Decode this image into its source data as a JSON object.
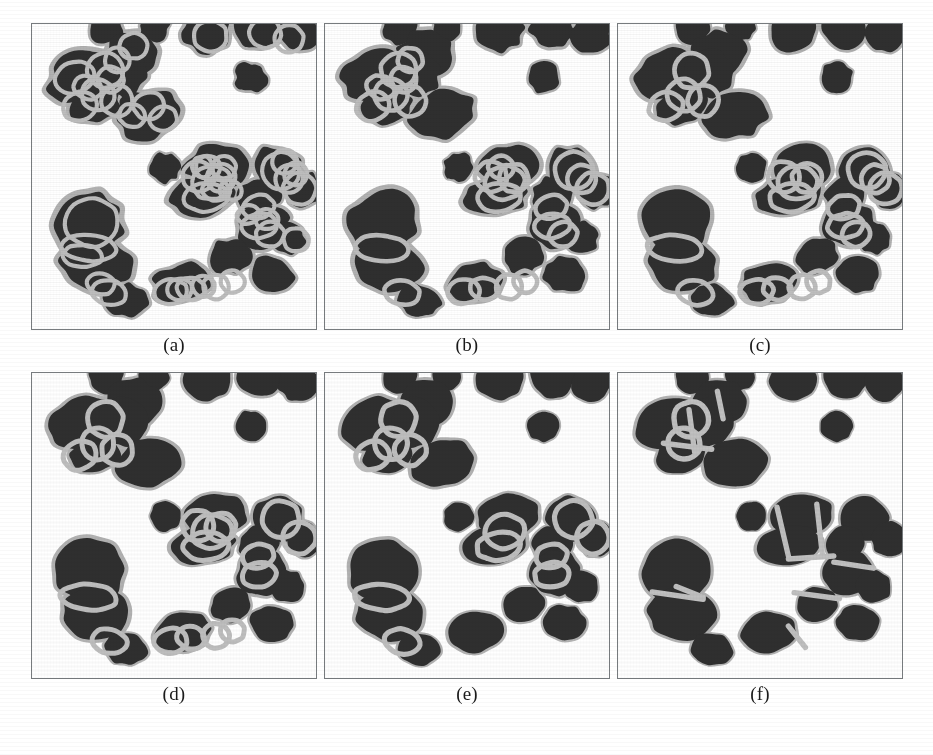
{
  "figure": {
    "background_color": "#ffffff",
    "panel_border_color": "#777b7e",
    "cell_fill_color": "#2f2f2f",
    "cell_halo_color": "#b2b2b2",
    "contour_color": "#b8b8b8",
    "caption_color": "#1a1a1a",
    "rows": 2,
    "columns": 3
  },
  "panels": [
    {
      "id": "a",
      "caption": "(a)",
      "x": 31,
      "y": 23,
      "width": 286,
      "height": 307,
      "caption_x": 31,
      "caption_y": 334,
      "caption_width": 286,
      "stage": "initial contour seeding",
      "contour_count": 46,
      "contour_style": "dense-overlapping",
      "contour_stroke": 4.2,
      "contour_color": "#bdbdbd",
      "blob_roughness": 0.16
    },
    {
      "id": "b",
      "caption": "(b)",
      "x": 324,
      "y": 23,
      "width": 286,
      "height": 307,
      "caption_x": 324,
      "caption_y": 334,
      "caption_width": 286,
      "stage": "iteration 1",
      "contour_count": 24,
      "contour_style": "overlapping",
      "contour_stroke": 4.6,
      "contour_color": "#bcbcbc",
      "blob_roughness": 0.12
    },
    {
      "id": "c",
      "caption": "(c)",
      "x": 617,
      "y": 23,
      "width": 286,
      "height": 307,
      "caption_x": 617,
      "caption_y": 334,
      "caption_width": 286,
      "stage": "iteration 2",
      "contour_count": 20,
      "contour_style": "overlapping",
      "contour_stroke": 4.8,
      "contour_color": "#bdbdbd",
      "blob_roughness": 0.1
    },
    {
      "id": "d",
      "caption": "(d)",
      "x": 31,
      "y": 372,
      "width": 286,
      "height": 307,
      "caption_x": 31,
      "caption_y": 683,
      "caption_width": 286,
      "stage": "iteration 3",
      "contour_count": 18,
      "contour_style": "overlapping",
      "contour_stroke": 5.0,
      "contour_color": "#bebebe",
      "blob_roughness": 0.09
    },
    {
      "id": "e",
      "caption": "(e)",
      "x": 324,
      "y": 372,
      "width": 286,
      "height": 307,
      "caption_x": 324,
      "caption_y": 683,
      "caption_width": 286,
      "stage": "iteration 4",
      "contour_count": 12,
      "contour_style": "sparse",
      "contour_stroke": 5.2,
      "contour_color": "#bebebe",
      "blob_roughness": 0.07
    },
    {
      "id": "f",
      "caption": "(f)",
      "x": 617,
      "y": 372,
      "width": 286,
      "height": 307,
      "caption_x": 617,
      "caption_y": 683,
      "caption_width": 286,
      "stage": "final segmentation",
      "contour_count": 2,
      "contour_style": "boundaries-only",
      "contour_stroke": 5.4,
      "contour_color": "#c0c0c0",
      "blob_roughness": 0.06
    }
  ],
  "cells": [
    {
      "cx": 0.262,
      "cy": 0.012,
      "rx": 0.06,
      "ry": 0.055,
      "rot": -12
    },
    {
      "cx": 0.43,
      "cy": 0.01,
      "rx": 0.052,
      "ry": 0.046,
      "rot": 8
    },
    {
      "cx": 0.615,
      "cy": 0.02,
      "rx": 0.082,
      "ry": 0.07,
      "rot": -6
    },
    {
      "cx": 0.8,
      "cy": 0.012,
      "rx": 0.078,
      "ry": 0.068,
      "rot": 14
    },
    {
      "cx": 0.938,
      "cy": 0.03,
      "rx": 0.07,
      "ry": 0.062,
      "rot": -18
    },
    {
      "cx": 0.355,
      "cy": 0.098,
      "rx": 0.098,
      "ry": 0.078,
      "rot": -8
    },
    {
      "cx": 0.175,
      "cy": 0.165,
      "rx": 0.118,
      "ry": 0.082,
      "rot": -22
    },
    {
      "cx": 0.318,
      "cy": 0.16,
      "rx": 0.085,
      "ry": 0.082,
      "rot": 10
    },
    {
      "cx": 0.222,
      "cy": 0.268,
      "rx": 0.09,
      "ry": 0.058,
      "rot": -14
    },
    {
      "cx": 0.412,
      "cy": 0.295,
      "rx": 0.113,
      "ry": 0.078,
      "rot": -10
    },
    {
      "cx": 0.77,
      "cy": 0.175,
      "rx": 0.056,
      "ry": 0.05,
      "rot": 0
    },
    {
      "cx": 0.47,
      "cy": 0.47,
      "rx": 0.052,
      "ry": 0.048,
      "rot": 0
    },
    {
      "cx": 0.648,
      "cy": 0.468,
      "rx": 0.108,
      "ry": 0.072,
      "rot": -6
    },
    {
      "cx": 0.868,
      "cy": 0.478,
      "rx": 0.088,
      "ry": 0.072,
      "rot": 16
    },
    {
      "cx": 0.6,
      "cy": 0.565,
      "rx": 0.115,
      "ry": 0.062,
      "rot": -9
    },
    {
      "cx": 0.8,
      "cy": 0.56,
      "rx": 0.072,
      "ry": 0.058,
      "rot": -20
    },
    {
      "cx": 0.955,
      "cy": 0.545,
      "rx": 0.062,
      "ry": 0.058,
      "rot": 6
    },
    {
      "cx": 0.205,
      "cy": 0.65,
      "rx": 0.118,
      "ry": 0.105,
      "rot": -5
    },
    {
      "cx": 0.225,
      "cy": 0.79,
      "rx": 0.118,
      "ry": 0.085,
      "rot": 6
    },
    {
      "cx": 0.81,
      "cy": 0.655,
      "rx": 0.088,
      "ry": 0.075,
      "rot": -12
    },
    {
      "cx": 0.9,
      "cy": 0.7,
      "rx": 0.062,
      "ry": 0.052,
      "rot": 12
    },
    {
      "cx": 0.7,
      "cy": 0.76,
      "rx": 0.072,
      "ry": 0.058,
      "rot": -16
    },
    {
      "cx": 0.53,
      "cy": 0.85,
      "rx": 0.098,
      "ry": 0.065,
      "rot": -8
    },
    {
      "cx": 0.33,
      "cy": 0.905,
      "rx": 0.075,
      "ry": 0.052,
      "rot": 10
    },
    {
      "cx": 0.845,
      "cy": 0.82,
      "rx": 0.075,
      "ry": 0.058,
      "rot": 8
    }
  ],
  "contours": [
    {
      "cx": 0.258,
      "cy": 0.152,
      "rx": 0.062,
      "ry": 0.058,
      "rot": -10,
      "tier": 1
    },
    {
      "cx": 0.232,
      "cy": 0.232,
      "rx": 0.058,
      "ry": 0.052,
      "rot": 20,
      "tier": 1
    },
    {
      "cx": 0.3,
      "cy": 0.252,
      "rx": 0.055,
      "ry": 0.05,
      "rot": -5,
      "tier": 1
    },
    {
      "cx": 0.168,
      "cy": 0.27,
      "rx": 0.06,
      "ry": 0.046,
      "rot": -18,
      "tier": 1
    },
    {
      "cx": 0.632,
      "cy": 0.52,
      "rx": 0.07,
      "ry": 0.055,
      "rot": -8,
      "tier": 1
    },
    {
      "cx": 0.612,
      "cy": 0.568,
      "rx": 0.078,
      "ry": 0.046,
      "rot": -6,
      "tier": 1
    },
    {
      "cx": 0.876,
      "cy": 0.48,
      "rx": 0.066,
      "ry": 0.06,
      "rot": 12,
      "tier": 1
    },
    {
      "cx": 0.942,
      "cy": 0.54,
      "rx": 0.058,
      "ry": 0.052,
      "rot": -4,
      "tier": 1
    },
    {
      "cx": 0.796,
      "cy": 0.6,
      "rx": 0.056,
      "ry": 0.038,
      "rot": -14,
      "tier": 1
    },
    {
      "cx": 0.8,
      "cy": 0.662,
      "rx": 0.062,
      "ry": 0.04,
      "rot": -8,
      "tier": 1
    },
    {
      "cx": 0.2,
      "cy": 0.735,
      "rx": 0.098,
      "ry": 0.042,
      "rot": 4,
      "tier": 1
    },
    {
      "cx": 0.272,
      "cy": 0.88,
      "rx": 0.062,
      "ry": 0.04,
      "rot": 12,
      "tier": 1
    },
    {
      "cx": 0.488,
      "cy": 0.878,
      "rx": 0.058,
      "ry": 0.04,
      "rot": -6,
      "tier": 2
    },
    {
      "cx": 0.56,
      "cy": 0.868,
      "rx": 0.05,
      "ry": 0.036,
      "rot": 8,
      "tier": 2
    },
    {
      "cx": 0.648,
      "cy": 0.862,
      "rx": 0.046,
      "ry": 0.04,
      "rot": 0,
      "tier": 2
    },
    {
      "cx": 0.706,
      "cy": 0.845,
      "rx": 0.042,
      "ry": 0.036,
      "rot": 10,
      "tier": 2
    },
    {
      "cx": 0.585,
      "cy": 0.5,
      "rx": 0.056,
      "ry": 0.05,
      "rot": 15,
      "tier": 2
    },
    {
      "cx": 0.665,
      "cy": 0.505,
      "rx": 0.052,
      "ry": 0.046,
      "rot": -12,
      "tier": 2
    },
    {
      "cx": 0.905,
      "cy": 0.508,
      "rx": 0.05,
      "ry": 0.046,
      "rot": 6,
      "tier": 2
    },
    {
      "cx": 0.838,
      "cy": 0.69,
      "rx": 0.05,
      "ry": 0.04,
      "rot": -10,
      "tier": 2
    },
    {
      "cx": 0.276,
      "cy": 0.182,
      "rx": 0.046,
      "ry": 0.042,
      "rot": 5,
      "tier": 3
    },
    {
      "cx": 0.3,
      "cy": 0.118,
      "rx": 0.044,
      "ry": 0.04,
      "rot": -9,
      "tier": 3
    },
    {
      "cx": 0.196,
      "cy": 0.208,
      "rx": 0.05,
      "ry": 0.038,
      "rot": 22,
      "tier": 3
    },
    {
      "cx": 0.62,
      "cy": 0.47,
      "rx": 0.044,
      "ry": 0.038,
      "rot": 0,
      "tier": 3
    },
    {
      "cx": 0.676,
      "cy": 0.47,
      "rx": 0.042,
      "ry": 0.036,
      "rot": -8,
      "tier": 3
    },
    {
      "cx": 0.648,
      "cy": 0.545,
      "rx": 0.048,
      "ry": 0.034,
      "rot": 4,
      "tier": 3
    },
    {
      "cx": 0.6,
      "cy": 0.468,
      "rx": 0.036,
      "ry": 0.034,
      "rot": 0,
      "tier": 3
    },
    {
      "cx": 0.7,
      "cy": 0.545,
      "rx": 0.04,
      "ry": 0.032,
      "rot": 14,
      "tier": 3
    },
    {
      "cx": 0.89,
      "cy": 0.452,
      "rx": 0.044,
      "ry": 0.04,
      "rot": 10,
      "tier": 3
    },
    {
      "cx": 0.928,
      "cy": 0.492,
      "rx": 0.04,
      "ry": 0.038,
      "rot": -6,
      "tier": 3
    },
    {
      "cx": 0.762,
      "cy": 0.625,
      "rx": 0.04,
      "ry": 0.03,
      "rot": -16,
      "tier": 3
    },
    {
      "cx": 0.826,
      "cy": 0.64,
      "rx": 0.042,
      "ry": 0.032,
      "rot": 8,
      "tier": 3
    },
    {
      "cx": 0.52,
      "cy": 0.87,
      "rx": 0.044,
      "ry": 0.036,
      "rot": -4,
      "tier": 3
    },
    {
      "cx": 0.604,
      "cy": 0.86,
      "rx": 0.04,
      "ry": 0.034,
      "rot": 6,
      "tier": 3
    },
    {
      "cx": 0.242,
      "cy": 0.852,
      "rx": 0.05,
      "ry": 0.034,
      "rot": 10,
      "tier": 3
    },
    {
      "cx": 0.178,
      "cy": 0.76,
      "rx": 0.07,
      "ry": 0.036,
      "rot": 2,
      "tier": 3
    },
    {
      "cx": 0.358,
      "cy": 0.072,
      "rx": 0.05,
      "ry": 0.042,
      "rot": -10,
      "tier": 3
    },
    {
      "cx": 0.412,
      "cy": 0.268,
      "rx": 0.054,
      "ry": 0.044,
      "rot": -8,
      "tier": 3
    },
    {
      "cx": 0.352,
      "cy": 0.3,
      "rx": 0.046,
      "ry": 0.038,
      "rot": 12,
      "tier": 3
    },
    {
      "cx": 0.462,
      "cy": 0.31,
      "rx": 0.048,
      "ry": 0.04,
      "rot": -14,
      "tier": 3
    },
    {
      "cx": 0.82,
      "cy": 0.03,
      "rx": 0.056,
      "ry": 0.048,
      "rot": 8,
      "tier": 3
    },
    {
      "cx": 0.905,
      "cy": 0.048,
      "rx": 0.05,
      "ry": 0.046,
      "rot": -12,
      "tier": 3
    },
    {
      "cx": 0.628,
      "cy": 0.04,
      "rx": 0.058,
      "ry": 0.05,
      "rot": -4,
      "tier": 3
    },
    {
      "cx": 0.15,
      "cy": 0.175,
      "rx": 0.07,
      "ry": 0.05,
      "rot": -22,
      "tier": 3
    },
    {
      "cx": 0.21,
      "cy": 0.65,
      "rx": 0.092,
      "ry": 0.08,
      "rot": -5,
      "tier": 3
    },
    {
      "cx": 0.93,
      "cy": 0.708,
      "rx": 0.044,
      "ry": 0.038,
      "rot": 10,
      "tier": 3
    }
  ]
}
